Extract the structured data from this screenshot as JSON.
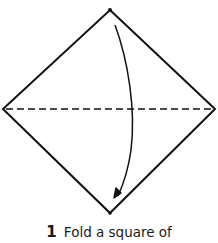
{
  "diagram": {
    "shape": "square-on-point",
    "vertices": {
      "top": [
        110,
        10
      ],
      "left": [
        3,
        109
      ],
      "right": [
        215,
        109
      ],
      "bottom": [
        110,
        213
      ]
    },
    "fold_line": {
      "style": "dashed",
      "from": [
        3,
        109
      ],
      "to": [
        215,
        109
      ]
    },
    "arrow": {
      "direction": "top-to-bottom",
      "meaning": "fold top corner down to bottom corner"
    },
    "colors": {
      "line": "#111111",
      "background": "#ffffff"
    }
  },
  "caption": {
    "step_number": "1",
    "text": "Fold a square of"
  }
}
